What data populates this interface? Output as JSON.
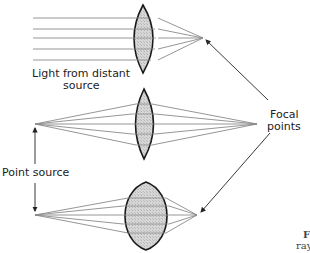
{
  "diagram": {
    "labels": {
      "distant_line1": "Light from distant",
      "distant_line2": "source",
      "focal_line1": "Focal",
      "focal_line2": "points",
      "point_source": "Point source"
    },
    "caption_fragment": {
      "line1": "F",
      "line2": "ray"
    },
    "colors": {
      "ray": "#8a8a8a",
      "lens_fill": "#cfcfcf",
      "lens_outline": "#1a1a1a",
      "arrow": "#222222"
    },
    "panels": [
      {
        "name": "distant-source",
        "lens_shape": "thin-convex",
        "source": "parallel rays",
        "focal_point": [
          203,
          38
        ]
      },
      {
        "name": "point-source-far",
        "lens_shape": "thin-convex",
        "source": [
          35,
          124
        ],
        "focal_point": [
          257,
          124
        ]
      },
      {
        "name": "point-source-near",
        "lens_shape": "thick-convex",
        "source": [
          35,
          215
        ],
        "focal_point": [
          197,
          215
        ]
      }
    ]
  }
}
